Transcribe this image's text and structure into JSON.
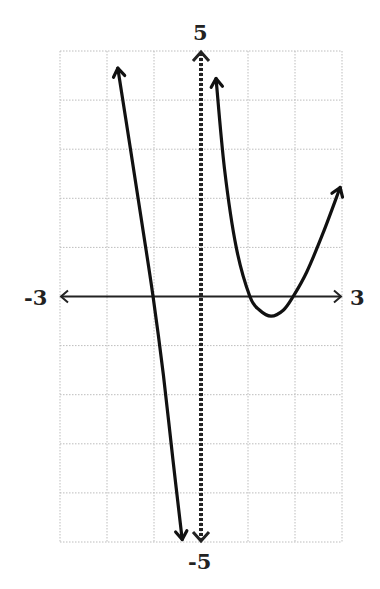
{
  "chart_data": {
    "type": "line",
    "title": "",
    "xlabel": "",
    "ylabel": "",
    "xlim": [
      -3,
      3
    ],
    "ylim": [
      -5,
      5
    ],
    "grid": true,
    "grid_step": {
      "x": 1,
      "y": 1
    },
    "tick_labels": {
      "x_min": "-3",
      "x_max": "3",
      "y_max": "5",
      "y_min": "-5"
    },
    "vertical_asymptote": {
      "x": 0,
      "style": "dashed",
      "arrows": "both"
    },
    "series": [
      {
        "name": "left-branch",
        "x": [
          -1.77,
          -1.5,
          -1.25,
          -1.02,
          -0.8,
          -0.6,
          -0.4
        ],
        "y": [
          4.65,
          3.0,
          1.45,
          0.0,
          -1.6,
          -3.3,
          -4.95
        ],
        "arrows": "both"
      },
      {
        "name": "right-branch",
        "x": [
          0.32,
          0.5,
          0.75,
          1.04,
          1.25,
          1.49,
          1.75,
          1.96,
          2.25,
          2.6,
          2.96
        ],
        "y": [
          4.44,
          2.6,
          1.0,
          0.0,
          -0.28,
          -0.4,
          -0.28,
          0.0,
          0.5,
          1.3,
          2.22
        ],
        "arrows": "both"
      }
    ],
    "x_intercepts": [
      -1.02,
      1.04,
      1.96
    ],
    "local_min": {
      "x": 1.49,
      "y": -0.4
    }
  },
  "labels": {
    "top": "5",
    "bottom": "-5",
    "left": "-3",
    "right": "3"
  }
}
